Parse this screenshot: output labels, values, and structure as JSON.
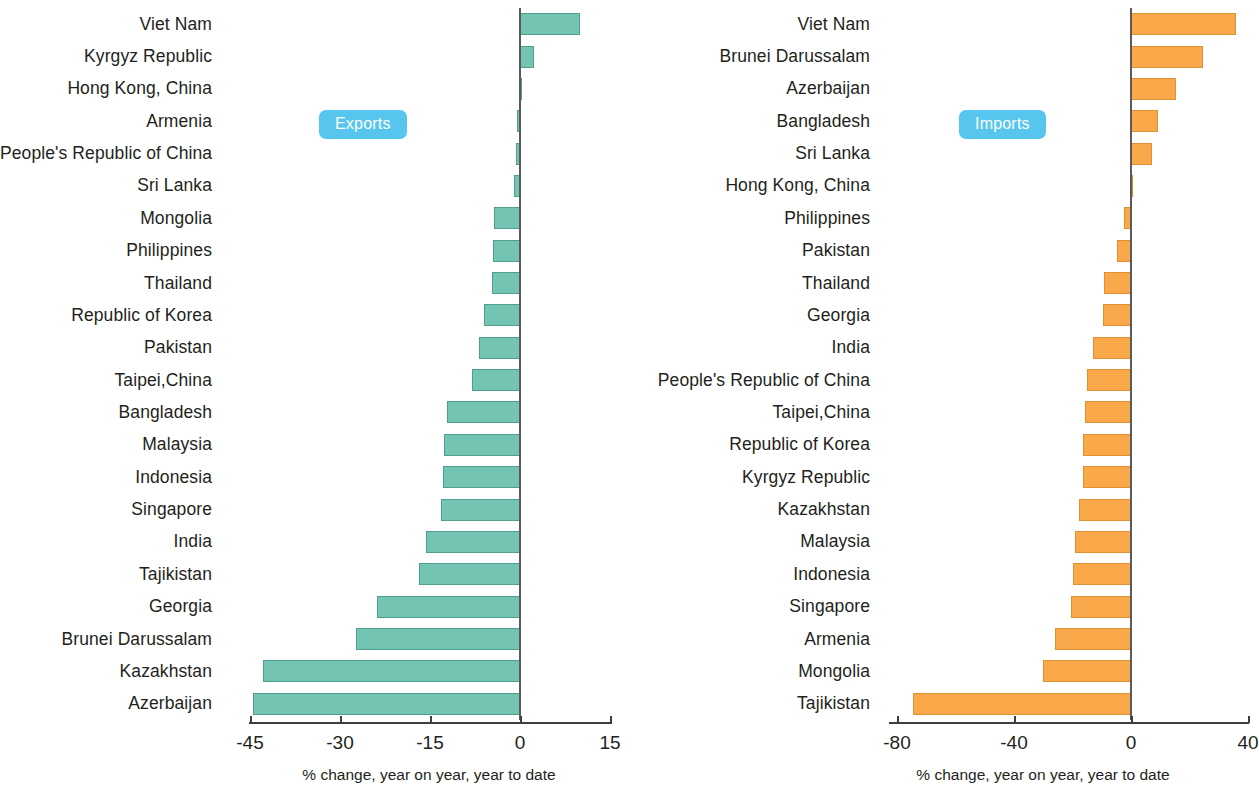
{
  "chart_data": [
    {
      "type": "bar",
      "orientation": "horizontal",
      "title": "Exports",
      "badge_label": "Exports",
      "badge_color": "#57c6ee",
      "bar_color": "#74c4b4",
      "xlabel": "% change, year on year, year to date",
      "ylabel": "",
      "xlim": [
        -45,
        15
      ],
      "xticks": [
        -45,
        -30,
        -15,
        0,
        15
      ],
      "xtick_labels": [
        "-45",
        "-30",
        "-15",
        "0",
        "15"
      ],
      "grid": false,
      "legend": "none",
      "categories": [
        "Viet Nam",
        "Kyrgyz Republic",
        "Hong Kong, China",
        "Armenia",
        "People's Republic of China",
        "Sri Lanka",
        "Mongolia",
        "Philippines",
        "Thailand",
        "Republic of Korea",
        "Pakistan",
        "Taipei,China",
        "Bangladesh",
        "Malaysia",
        "Indonesia",
        "Singapore",
        "India",
        "Tajikistan",
        "Georgia",
        "Brunei Darussalam",
        "Kazakhstan",
        "Azerbaijan"
      ],
      "values": [
        10.0,
        2.4,
        0.1,
        -0.5,
        -0.7,
        -1.0,
        -4.3,
        -4.5,
        -4.6,
        -6.0,
        -6.8,
        -8.0,
        -12.2,
        -12.6,
        -12.9,
        -13.2,
        -15.6,
        -16.8,
        -23.8,
        -27.3,
        -42.8,
        -44.5
      ]
    },
    {
      "type": "bar",
      "orientation": "horizontal",
      "title": "Imports",
      "badge_label": "Imports",
      "badge_color": "#57c6ee",
      "bar_color": "#f9a94a",
      "xlabel": "% change, year on year, year to date",
      "ylabel": "",
      "xlim": [
        -80,
        40
      ],
      "xticks": [
        -80,
        -40,
        0,
        40
      ],
      "xtick_labels": [
        "-80",
        "-40",
        "0",
        "40"
      ],
      "grid": false,
      "legend": "none",
      "categories": [
        "Viet Nam",
        "Brunei Darussalam",
        "Azerbaijan",
        "Bangladesh",
        "Sri Lanka",
        "Hong Kong, China",
        "Philippines",
        "Pakistan",
        "Thailand",
        "Georgia",
        "India",
        "People's Republic of China",
        "Taipei,China",
        "Republic of Korea",
        "Kyrgyz Republic",
        "Kazakhstan",
        "Malaysia",
        "Indonesia",
        "Singapore",
        "Armenia",
        "Mongolia",
        "Tajikistan"
      ],
      "values": [
        35.8,
        24.6,
        15.4,
        9.2,
        7.2,
        0.8,
        -2.4,
        -4.8,
        -9.2,
        -9.6,
        -13.0,
        -15.0,
        -15.7,
        -16.4,
        -16.5,
        -17.7,
        -19.0,
        -19.8,
        -20.5,
        -26.0,
        -30.0,
        -74.5
      ]
    }
  ]
}
